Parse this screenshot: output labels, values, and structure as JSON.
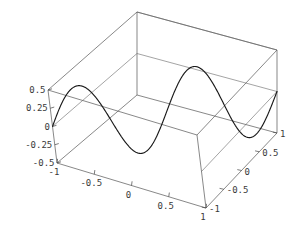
{
  "figure": {
    "kind": "parametric-curve-3d",
    "background_color": "#ffffff",
    "curve_color": "#1a1a1a",
    "frame_color": "#555555",
    "label_color": "#3a3a3a",
    "width": 293,
    "height": 250
  },
  "chart_data": {
    "type": "line",
    "title": "",
    "xlabel": "",
    "ylabel": "",
    "zlabel": "",
    "projection": "3d",
    "grid": true,
    "legend": null,
    "xlim": [
      -1,
      1
    ],
    "ylim": [
      -1,
      1
    ],
    "zlim": [
      -0.5,
      0.5
    ],
    "axes": {
      "x": {
        "name": "x",
        "range": [
          -1,
          1
        ],
        "tick_labels": [
          "-1",
          "-0.5",
          "0",
          "0.5",
          "1"
        ],
        "tick_values": [
          -1,
          -0.5,
          0,
          0.5,
          1
        ],
        "position": "bottom-front-left"
      },
      "y": {
        "name": "y",
        "range": [
          -1,
          1
        ],
        "tick_labels": [
          "-1",
          "-0.5",
          "0",
          "0.5",
          "1"
        ],
        "tick_values": [
          -1,
          -0.5,
          0,
          0.5,
          1
        ],
        "position": "bottom-front-right"
      },
      "z": {
        "name": "z",
        "range": [
          -0.5,
          0.5
        ],
        "tick_labels": [
          "0.5",
          "0.25",
          "0",
          "-0.25",
          "-0.5"
        ],
        "tick_values": [
          0.5,
          0.25,
          0,
          -0.25,
          -0.5
        ],
        "position": "left-vertical"
      }
    },
    "series": [
      {
        "name": "curve",
        "description": "sinusoidal space curve sweeping across x with oscillating z and y",
        "parameter": "t",
        "t_range": [
          -1,
          1
        ],
        "x": [
          -1.0,
          -0.95,
          -0.9,
          -0.85,
          -0.8,
          -0.75,
          -0.7,
          -0.65,
          -0.6,
          -0.55,
          -0.5,
          -0.45,
          -0.4,
          -0.35,
          -0.3,
          -0.25,
          -0.2,
          -0.15,
          -0.1,
          -0.05,
          0.0,
          0.05,
          0.1,
          0.15,
          0.2,
          0.25,
          0.3,
          0.35,
          0.4,
          0.45,
          0.5,
          0.55,
          0.6,
          0.65,
          0.7,
          0.75,
          0.8,
          0.85,
          0.9,
          0.95,
          1.0
        ],
        "y": [
          -1.0,
          -0.95,
          -0.9,
          -0.85,
          -0.8,
          -0.75,
          -0.7,
          -0.65,
          -0.6,
          -0.55,
          -0.5,
          -0.45,
          -0.4,
          -0.35,
          -0.3,
          -0.25,
          -0.2,
          -0.15,
          -0.1,
          -0.05,
          0.0,
          0.05,
          0.1,
          0.15,
          0.2,
          0.25,
          0.3,
          0.35,
          0.4,
          0.45,
          0.5,
          0.55,
          0.6,
          0.65,
          0.7,
          0.75,
          0.8,
          0.85,
          0.9,
          0.95,
          1.0
        ],
        "z": [
          0.0,
          0.156,
          0.309,
          0.454,
          0.588,
          0.707,
          0.809,
          0.891,
          0.951,
          0.988,
          1.0,
          0.988,
          0.951,
          0.891,
          0.809,
          0.707,
          0.588,
          0.454,
          0.309,
          0.156,
          0.0,
          -0.156,
          -0.309,
          -0.454,
          -0.588,
          -0.707,
          -0.809,
          -0.891,
          -0.951,
          -0.988,
          -1.0,
          -0.988,
          -0.951,
          -0.891,
          -0.809,
          -0.707,
          -0.588,
          -0.454,
          -0.309,
          -0.156,
          0.0
        ]
      }
    ]
  }
}
